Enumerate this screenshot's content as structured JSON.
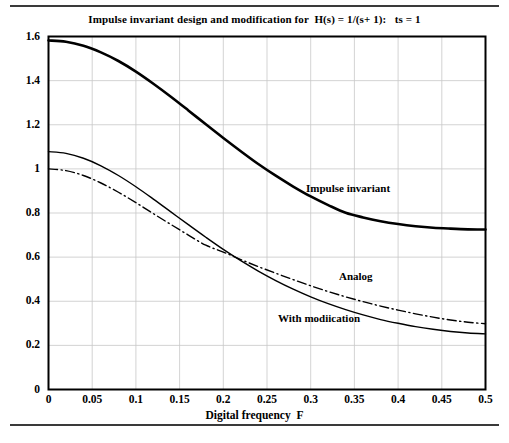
{
  "chart_data": {
    "type": "line",
    "title": "Impulse invariant design and modification for  H(s) = 1/(s+ 1):   ts = 1",
    "xlabel": "Digital frequency  F",
    "ylabel": "",
    "xlim": [
      0,
      0.5
    ],
    "ylim": [
      0,
      1.6
    ],
    "grid": true,
    "legend_position": "inline-annotations",
    "xticks": [
      "0",
      "0.05",
      "0.1",
      "0.15",
      "0.2",
      "0.25",
      "0.3",
      "0.35",
      "0.4",
      "0.45",
      "0.5"
    ],
    "xtick_values": [
      0,
      0.05,
      0.1,
      0.15,
      0.2,
      0.25,
      0.3,
      0.35,
      0.4,
      0.45,
      0.5
    ],
    "yticks": [
      "0",
      "0.2",
      "0.4",
      "0.6",
      "0.8",
      "1",
      "1.2",
      "1.4",
      "1.6"
    ],
    "ytick_values": [
      0,
      0.2,
      0.4,
      0.6,
      0.8,
      1.0,
      1.2,
      1.4,
      1.6
    ],
    "x": [
      0,
      0.02,
      0.04,
      0.06,
      0.08,
      0.1,
      0.12,
      0.14,
      0.16,
      0.18,
      0.2,
      0.22,
      0.24,
      0.26,
      0.28,
      0.3,
      0.32,
      0.34,
      0.36,
      0.38,
      0.4,
      0.42,
      0.44,
      0.46,
      0.48,
      0.5
    ],
    "series": [
      {
        "name": "Impulse invariant",
        "style": "solid-thick",
        "color": "#000000",
        "values": [
          1.582,
          1.576,
          1.558,
          1.528,
          1.489,
          1.441,
          1.386,
          1.327,
          1.265,
          1.202,
          1.14,
          1.08,
          1.022,
          0.969,
          0.92,
          0.875,
          0.836,
          0.801,
          0.78,
          0.763,
          0.75,
          0.74,
          0.733,
          0.729,
          0.726,
          0.725
        ]
      },
      {
        "name": "With modiication",
        "style": "solid-thin",
        "color": "#000000",
        "values": [
          1.078,
          1.07,
          1.048,
          1.014,
          0.97,
          0.919,
          0.863,
          0.805,
          0.747,
          0.69,
          0.635,
          0.584,
          0.537,
          0.494,
          0.455,
          0.42,
          0.389,
          0.362,
          0.338,
          0.317,
          0.3,
          0.285,
          0.273,
          0.263,
          0.256,
          0.252
        ]
      },
      {
        "name": "Analog",
        "style": "dash-dot",
        "color": "#000000",
        "values": [
          1.0,
          0.992,
          0.97,
          0.936,
          0.894,
          0.847,
          0.797,
          0.748,
          0.7,
          0.654,
          0.623,
          0.589,
          0.557,
          0.527,
          0.498,
          0.47,
          0.444,
          0.42,
          0.398,
          0.378,
          0.36,
          0.343,
          0.328,
          0.315,
          0.305,
          0.298
        ]
      }
    ],
    "annotations": [
      {
        "text": "Impulse invariant",
        "x": 0.295,
        "y": 0.94
      },
      {
        "text": "Analog",
        "x": 0.333,
        "y": 0.545
      },
      {
        "text": "With modiication",
        "x": 0.263,
        "y": 0.355
      }
    ],
    "colors": {
      "axis": "#000000",
      "grid": "#c8c8c8",
      "curve": "#000000",
      "rule": "#3a3a3a",
      "background": "#ffffff"
    }
  }
}
